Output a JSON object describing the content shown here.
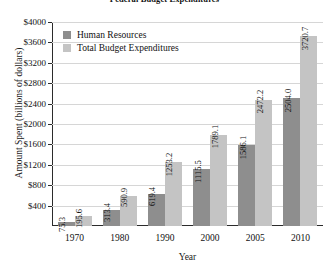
{
  "chart_data": {
    "type": "bar",
    "title": "Federal Budget Expenditures",
    "xlabel": "Year",
    "ylabel": "Amount Spent (billions of dollars)",
    "categories": [
      "1970",
      "1980",
      "1990",
      "2000",
      "2005",
      "2010"
    ],
    "series": [
      {
        "name": "Human Resources",
        "color": "#8e8e8e",
        "values": [
          75.3,
          313.4,
          619.4,
          1115.5,
          1586.1,
          2504.0
        ],
        "labels": [
          "75.3",
          "313.4",
          "619.4",
          "1115.5",
          "1586.1",
          "2504.0"
        ]
      },
      {
        "name": "Total Budget Expenditures",
        "color": "#c4c4c4",
        "values": [
          195.6,
          590.9,
          1253.2,
          1789.1,
          2472.2,
          3720.7
        ],
        "labels": [
          "195.6",
          "590.9",
          "1253.2",
          "1789.1",
          "2472.2",
          "3720.7"
        ]
      }
    ],
    "ylim": [
      0,
      4000
    ],
    "yticks": [
      400,
      800,
      1200,
      1600,
      2000,
      2400,
      2800,
      3200,
      3600,
      4000
    ],
    "ytick_labels": [
      "$400",
      "$800",
      "$1200",
      "$1600",
      "$2000",
      "$2400",
      "$2800",
      "$3200",
      "$3600",
      "$4000"
    ],
    "grid": true,
    "legend_position": "upper left"
  }
}
